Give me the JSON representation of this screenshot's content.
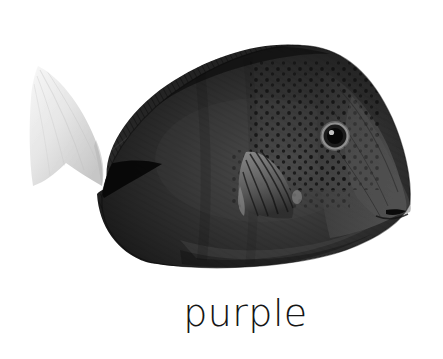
{
  "card": {
    "title": "purple",
    "background_color": "#ffffff"
  },
  "image": {
    "subject": "fish",
    "subject_detail": "purple tang fish, side view, facing right",
    "alt_text": "purple tang fish",
    "rendering": "grayscale photograph",
    "body_color": "#2b2b2b",
    "body_shadow_color": "#161616",
    "body_highlight_color": "#595959",
    "tail_color": "#ececeb",
    "tail_shadow_color": "#cfcfcf",
    "fin_color": "#6e6e6e",
    "eye_color": "#0d0d0d",
    "eye_ring_color": "#9a9a9a",
    "spot_color": "#101010",
    "parts": [
      "dorsal-fin",
      "caudal-fin",
      "pectoral-fin",
      "anal-fin",
      "eye",
      "mouth",
      "body-spots"
    ]
  },
  "caption": {
    "text": "purple",
    "color": "#151515",
    "font_size_px": 38,
    "align": "center"
  }
}
